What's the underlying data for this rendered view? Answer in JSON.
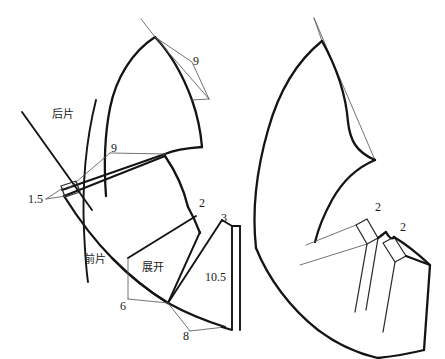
{
  "diagram": {
    "type": "technical-sewing-pattern",
    "background_color": "#ffffff",
    "line_color": "#141414",
    "construction_line_color": "#5a5a5a",
    "width": 445,
    "height": 359
  },
  "left_figure": {
    "name": "left-pattern-piece",
    "labels": {
      "back_piece": "后片",
      "front_piece": "前片",
      "spread": "展开"
    },
    "dimensions": {
      "top_dart": "9",
      "mid_dart": "9",
      "slit_width": "1.5",
      "notch_upper": "2",
      "notch_right": "3",
      "side_height": "10.5",
      "lower_left": "6",
      "lower_right": "8"
    }
  },
  "right_figure": {
    "name": "right-pattern-piece",
    "dimensions": {
      "dart_one": "2",
      "dart_two": "2"
    }
  },
  "all_dimension_values": [
    "9",
    "9",
    "1.5",
    "2",
    "3",
    "10.5",
    "6",
    "8",
    "2",
    "2"
  ],
  "chinese_annotations": [
    "后片",
    "前片",
    "展开"
  ]
}
